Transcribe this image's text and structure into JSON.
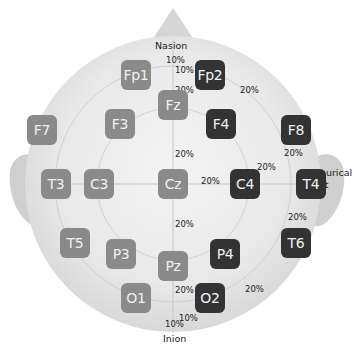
{
  "diagram": {
    "landmarks": {
      "nasion": "Nasion",
      "inion": "Inion",
      "preauricular_line1": "Preaurical",
      "preauricular_line2": "Point"
    },
    "colors": {
      "left_hemisphere_and_midline": "#8a8a8a",
      "right_hemisphere": "#333333",
      "head_fill": "#e4e4e4",
      "ring_lines": "#d4d4d4"
    },
    "electrodes": [
      {
        "id": "Fp1",
        "x": 136,
        "y": 75,
        "side": "light"
      },
      {
        "id": "Fp2",
        "x": 210,
        "y": 75,
        "side": "dark"
      },
      {
        "id": "F7",
        "x": 42,
        "y": 130,
        "side": "light"
      },
      {
        "id": "F3",
        "x": 120,
        "y": 124,
        "side": "light"
      },
      {
        "id": "Fz",
        "x": 173,
        "y": 105,
        "side": "light"
      },
      {
        "id": "F4",
        "x": 221,
        "y": 124,
        "side": "dark"
      },
      {
        "id": "F8",
        "x": 296,
        "y": 130,
        "side": "dark"
      },
      {
        "id": "T3",
        "x": 56,
        "y": 184,
        "side": "light"
      },
      {
        "id": "C3",
        "x": 99,
        "y": 184,
        "side": "light"
      },
      {
        "id": "Cz",
        "x": 173,
        "y": 184,
        "side": "light"
      },
      {
        "id": "C4",
        "x": 245,
        "y": 184,
        "side": "dark"
      },
      {
        "id": "T4",
        "x": 311,
        "y": 184,
        "side": "dark"
      },
      {
        "id": "T5",
        "x": 75,
        "y": 243,
        "side": "light"
      },
      {
        "id": "P3",
        "x": 121,
        "y": 254,
        "side": "light"
      },
      {
        "id": "Pz",
        "x": 173,
        "y": 266,
        "side": "light"
      },
      {
        "id": "P4",
        "x": 225,
        "y": 254,
        "side": "dark"
      },
      {
        "id": "T6",
        "x": 296,
        "y": 243,
        "side": "dark"
      },
      {
        "id": "O1",
        "x": 136,
        "y": 298,
        "side": "light"
      },
      {
        "id": "O2",
        "x": 210,
        "y": 298,
        "side": "dark"
      }
    ],
    "percent_labels": [
      {
        "text": "10%",
        "x": 166,
        "y": 56
      },
      {
        "text": "10%",
        "x": 175,
        "y": 66
      },
      {
        "text": "20%",
        "x": 175,
        "y": 86
      },
      {
        "text": "20%",
        "x": 240,
        "y": 86
      },
      {
        "text": "20%",
        "x": 175,
        "y": 150
      },
      {
        "text": "20%",
        "x": 284,
        "y": 149
      },
      {
        "text": "20%",
        "x": 257,
        "y": 163
      },
      {
        "text": "20%",
        "x": 201,
        "y": 177
      },
      {
        "text": "10%",
        "x": 298,
        "y": 192
      },
      {
        "text": "20%",
        "x": 288,
        "y": 213
      },
      {
        "text": "20%",
        "x": 175,
        "y": 220
      },
      {
        "text": "20%",
        "x": 175,
        "y": 286
      },
      {
        "text": "20%",
        "x": 245,
        "y": 285
      },
      {
        "text": "10%",
        "x": 179,
        "y": 314
      },
      {
        "text": "10%",
        "x": 165,
        "y": 320
      }
    ]
  }
}
